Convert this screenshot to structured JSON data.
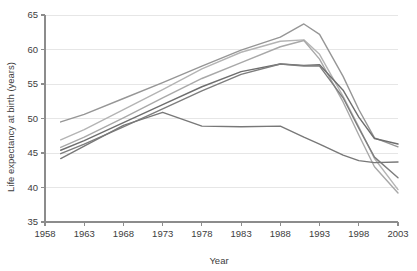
{
  "chart_data": {
    "type": "line",
    "title": "",
    "xlabel": "Year",
    "ylabel": "Life expectancy at birth (years)",
    "xlim": [
      1958,
      2003
    ],
    "ylim": [
      35,
      65
    ],
    "xticks": [
      1958,
      1963,
      1968,
      1973,
      1978,
      1983,
      1988,
      1993,
      1998,
      2003
    ],
    "yticks": [
      35,
      40,
      45,
      50,
      55,
      60,
      65
    ],
    "grid": true,
    "legend": "none",
    "x": [
      1960,
      1963,
      1968,
      1973,
      1978,
      1983,
      1988,
      1991,
      1993,
      1996,
      1998,
      2000,
      2003
    ],
    "series": [
      {
        "name": "series-1",
        "color": "#969696",
        "values": [
          49.5,
          50.6,
          52.9,
          55.2,
          57.6,
          59.9,
          61.8,
          63.7,
          62.2,
          56.1,
          51.3,
          47.2,
          45.9
        ]
      },
      {
        "name": "series-2",
        "color": "#b4b4b4",
        "values": [
          46.9,
          48.4,
          51.3,
          54.2,
          57.2,
          59.6,
          61.2,
          61.4,
          59.3,
          53.2,
          48.8,
          44.2,
          39.7
        ]
      },
      {
        "name": "series-3",
        "color": "#a8a8a8",
        "values": [
          45.8,
          47.3,
          50.1,
          53.0,
          55.8,
          58.1,
          60.4,
          61.3,
          58.6,
          52.4,
          47.6,
          43.0,
          39.2
        ]
      },
      {
        "name": "series-4",
        "color": "#6e6e6e",
        "values": [
          45.4,
          46.8,
          49.4,
          52.0,
          54.6,
          56.8,
          57.9,
          57.7,
          57.8,
          54.1,
          50.2,
          47.1,
          46.3
        ]
      },
      {
        "name": "series-5",
        "color": "#7d7d7d",
        "values": [
          44.9,
          46.3,
          48.8,
          51.4,
          54.0,
          56.4,
          57.9,
          57.6,
          57.6,
          53.0,
          48.6,
          44.4,
          41.4
        ]
      },
      {
        "name": "series-6",
        "color": "#787878",
        "values": [
          44.2,
          46.0,
          49.0,
          50.9,
          48.9,
          48.8,
          48.9,
          47.3,
          46.3,
          44.7,
          43.9,
          43.6,
          43.7
        ]
      }
    ]
  }
}
